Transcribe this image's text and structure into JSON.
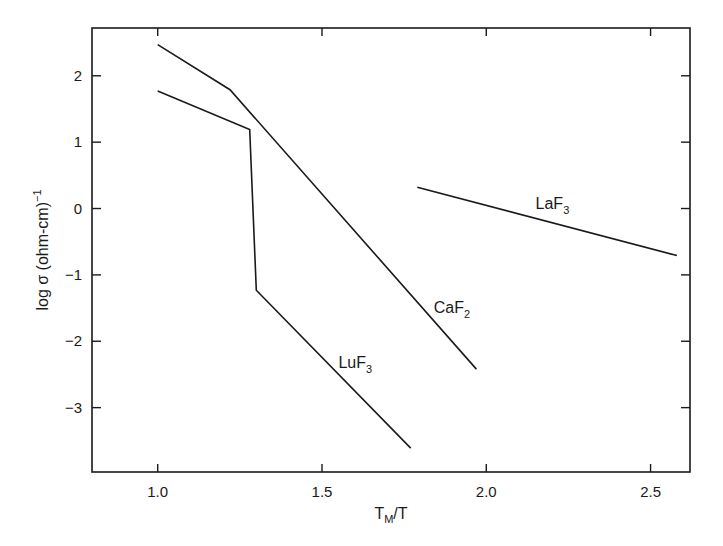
{
  "chart_data": {
    "type": "line",
    "title": "",
    "xlabel": "T_M/T",
    "xlabel_main": "T",
    "xlabel_sub": "M",
    "xlabel_tail": "/T",
    "ylabel": "log σ (ohm-cm)^-1",
    "ylabel_main": "log σ (ohm-cm)",
    "ylabel_sup": "−1",
    "xlim": [
      0.8,
      2.62
    ],
    "ylim": [
      -3.97,
      2.72
    ],
    "grid": false,
    "legend": "none (inline labels)",
    "x_ticks": [
      1.0,
      1.5,
      2.0,
      2.5
    ],
    "x_tick_labels": [
      "1.0",
      "1.5",
      "2.0",
      "2.5"
    ],
    "y_ticks": [
      2,
      1,
      0,
      -1,
      -2,
      -3
    ],
    "y_tick_labels": [
      "2",
      "1",
      "0",
      "−1",
      "−2",
      "−3"
    ],
    "series": [
      {
        "name": "CaF2",
        "label_main": "CaF",
        "label_sub": "2",
        "label_pos": [
          1.84,
          -1.58
        ],
        "x": [
          1.0,
          1.22,
          1.97
        ],
        "y": [
          2.47,
          1.79,
          -2.42
        ]
      },
      {
        "name": "LuF3",
        "label_main": "LuF",
        "label_sub": "3",
        "label_pos": [
          1.55,
          -2.4
        ],
        "x": [
          1.0,
          1.28,
          1.3,
          1.77
        ],
        "y": [
          1.77,
          1.19,
          -1.23,
          -3.61
        ]
      },
      {
        "name": "LaF3",
        "label_main": "LaF",
        "label_sub": "3",
        "label_pos": [
          2.15,
          0.0
        ],
        "x": [
          1.79,
          2.58
        ],
        "y": [
          0.32,
          -0.71
        ]
      }
    ]
  }
}
